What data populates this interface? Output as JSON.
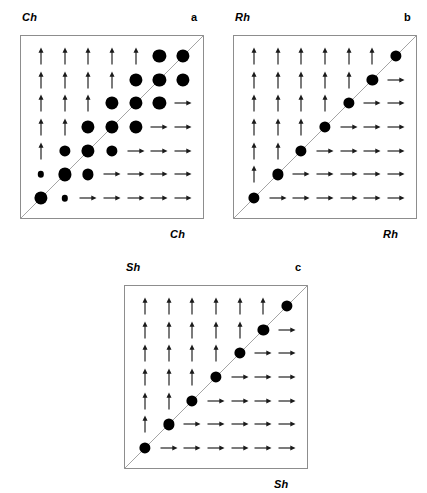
{
  "figure": {
    "background_color": "#ffffff",
    "glyph_color": "#000000",
    "box_border_color": "#8d8d8d",
    "diagonal_color": "#9a9a9a",
    "grid_size": 7
  },
  "panels": [
    {
      "id": "panel-a",
      "letter": "a",
      "top_label": "Ch",
      "bottom_label": "Ch",
      "box": {
        "left": 20,
        "top": 35,
        "size": 184
      },
      "letter_pos": {
        "left": 191,
        "top": 11
      },
      "top_label_pos": {
        "left": 22,
        "top": 11
      },
      "bottom_label_pos": {
        "left": 170,
        "top": 228
      }
    },
    {
      "id": "panel-b",
      "letter": "b",
      "top_label": "Rh",
      "bottom_label": "Rh",
      "box": {
        "left": 233,
        "top": 35,
        "size": 184
      },
      "letter_pos": {
        "left": 404,
        "top": 11
      },
      "top_label_pos": {
        "left": 235,
        "top": 11
      },
      "bottom_label_pos": {
        "left": 383,
        "top": 228
      }
    },
    {
      "id": "panel-c",
      "letter": "c",
      "top_label": "Sh",
      "bottom_label": "Sh",
      "box": {
        "left": 124,
        "top": 285,
        "size": 184
      },
      "letter_pos": {
        "left": 295,
        "top": 261
      },
      "top_label_pos": {
        "left": 126,
        "top": 261
      },
      "bottom_label_pos": {
        "left": 274,
        "top": 478
      }
    }
  ],
  "chart_data": {
    "type": "heatmap",
    "title": "",
    "xlabel": "",
    "ylabel": "",
    "grid": true,
    "legend": "none",
    "mark_legend": {
      "up": "up-arrow",
      "right": "right-arrow",
      "dot": "filled circle (radius = magnitude)"
    },
    "dot_radii_px": {
      "small": 3.2,
      "medium": 5.6,
      "large": 6.6
    },
    "panels": [
      {
        "id": "panel-a",
        "letter": "a",
        "axis": "Ch",
        "rows_top_to_bottom": [
          [
            {
              "mark": "up"
            },
            {
              "mark": "up"
            },
            {
              "mark": "up"
            },
            {
              "mark": "up"
            },
            {
              "mark": "up"
            },
            {
              "mark": "dot",
              "size": "large"
            },
            {
              "mark": "dot",
              "size": "large"
            }
          ],
          [
            {
              "mark": "up"
            },
            {
              "mark": "up"
            },
            {
              "mark": "up"
            },
            {
              "mark": "up"
            },
            {
              "mark": "dot",
              "size": "large"
            },
            {
              "mark": "dot",
              "size": "large"
            },
            {
              "mark": "dot",
              "size": "large"
            }
          ],
          [
            {
              "mark": "up"
            },
            {
              "mark": "up"
            },
            {
              "mark": "up"
            },
            {
              "mark": "dot",
              "size": "large"
            },
            {
              "mark": "dot",
              "size": "large"
            },
            {
              "mark": "dot",
              "size": "large"
            },
            {
              "mark": "right"
            }
          ],
          [
            {
              "mark": "up"
            },
            {
              "mark": "up"
            },
            {
              "mark": "dot",
              "size": "large"
            },
            {
              "mark": "dot",
              "size": "large"
            },
            {
              "mark": "dot",
              "size": "large"
            },
            {
              "mark": "right"
            },
            {
              "mark": "right"
            }
          ],
          [
            {
              "mark": "up"
            },
            {
              "mark": "dot",
              "size": "medium"
            },
            {
              "mark": "dot",
              "size": "large"
            },
            {
              "mark": "dot",
              "size": "medium"
            },
            {
              "mark": "right"
            },
            {
              "mark": "right"
            },
            {
              "mark": "right"
            }
          ],
          [
            {
              "mark": "dot",
              "size": "small"
            },
            {
              "mark": "dot",
              "size": "large"
            },
            {
              "mark": "dot",
              "size": "medium"
            },
            {
              "mark": "right"
            },
            {
              "mark": "right"
            },
            {
              "mark": "right"
            },
            {
              "mark": "right"
            }
          ],
          [
            {
              "mark": "dot",
              "size": "large"
            },
            {
              "mark": "dot",
              "size": "small"
            },
            {
              "mark": "right"
            },
            {
              "mark": "right"
            },
            {
              "mark": "right"
            },
            {
              "mark": "right"
            },
            {
              "mark": "right"
            }
          ]
        ]
      },
      {
        "id": "panel-b",
        "letter": "b",
        "axis": "Rh",
        "rows_top_to_bottom": [
          [
            {
              "mark": "up"
            },
            {
              "mark": "up"
            },
            {
              "mark": "up"
            },
            {
              "mark": "up"
            },
            {
              "mark": "up"
            },
            {
              "mark": "up"
            },
            {
              "mark": "dot",
              "size": "medium"
            }
          ],
          [
            {
              "mark": "up"
            },
            {
              "mark": "up"
            },
            {
              "mark": "up"
            },
            {
              "mark": "up"
            },
            {
              "mark": "up"
            },
            {
              "mark": "dot",
              "size": "medium"
            },
            {
              "mark": "right"
            }
          ],
          [
            {
              "mark": "up"
            },
            {
              "mark": "up"
            },
            {
              "mark": "up"
            },
            {
              "mark": "up"
            },
            {
              "mark": "dot",
              "size": "medium"
            },
            {
              "mark": "right"
            },
            {
              "mark": "right"
            }
          ],
          [
            {
              "mark": "up"
            },
            {
              "mark": "up"
            },
            {
              "mark": "up"
            },
            {
              "mark": "dot",
              "size": "medium"
            },
            {
              "mark": "right"
            },
            {
              "mark": "right"
            },
            {
              "mark": "right"
            }
          ],
          [
            {
              "mark": "up"
            },
            {
              "mark": "up"
            },
            {
              "mark": "dot",
              "size": "medium"
            },
            {
              "mark": "right"
            },
            {
              "mark": "right"
            },
            {
              "mark": "right"
            },
            {
              "mark": "right"
            }
          ],
          [
            {
              "mark": "up"
            },
            {
              "mark": "dot",
              "size": "medium"
            },
            {
              "mark": "right"
            },
            {
              "mark": "right"
            },
            {
              "mark": "right"
            },
            {
              "mark": "right"
            },
            {
              "mark": "right"
            }
          ],
          [
            {
              "mark": "dot",
              "size": "medium"
            },
            {
              "mark": "right"
            },
            {
              "mark": "right"
            },
            {
              "mark": "right"
            },
            {
              "mark": "right"
            },
            {
              "mark": "right"
            },
            {
              "mark": "right"
            }
          ]
        ]
      },
      {
        "id": "panel-c",
        "letter": "c",
        "axis": "Sh",
        "rows_top_to_bottom": [
          [
            {
              "mark": "up"
            },
            {
              "mark": "up"
            },
            {
              "mark": "up"
            },
            {
              "mark": "up"
            },
            {
              "mark": "up"
            },
            {
              "mark": "up"
            },
            {
              "mark": "dot",
              "size": "medium"
            }
          ],
          [
            {
              "mark": "up"
            },
            {
              "mark": "up"
            },
            {
              "mark": "up"
            },
            {
              "mark": "up"
            },
            {
              "mark": "up"
            },
            {
              "mark": "dot",
              "size": "medium"
            },
            {
              "mark": "right"
            }
          ],
          [
            {
              "mark": "up"
            },
            {
              "mark": "up"
            },
            {
              "mark": "up"
            },
            {
              "mark": "up"
            },
            {
              "mark": "dot",
              "size": "medium"
            },
            {
              "mark": "right"
            },
            {
              "mark": "right"
            }
          ],
          [
            {
              "mark": "up"
            },
            {
              "mark": "up"
            },
            {
              "mark": "up"
            },
            {
              "mark": "dot",
              "size": "medium"
            },
            {
              "mark": "right"
            },
            {
              "mark": "right"
            },
            {
              "mark": "right"
            }
          ],
          [
            {
              "mark": "up"
            },
            {
              "mark": "up"
            },
            {
              "mark": "dot",
              "size": "medium"
            },
            {
              "mark": "right"
            },
            {
              "mark": "right"
            },
            {
              "mark": "right"
            },
            {
              "mark": "right"
            }
          ],
          [
            {
              "mark": "up"
            },
            {
              "mark": "dot",
              "size": "medium"
            },
            {
              "mark": "right"
            },
            {
              "mark": "right"
            },
            {
              "mark": "right"
            },
            {
              "mark": "right"
            },
            {
              "mark": "right"
            }
          ],
          [
            {
              "mark": "dot",
              "size": "medium"
            },
            {
              "mark": "right"
            },
            {
              "mark": "right"
            },
            {
              "mark": "right"
            },
            {
              "mark": "right"
            },
            {
              "mark": "right"
            },
            {
              "mark": "right"
            }
          ]
        ]
      }
    ]
  }
}
